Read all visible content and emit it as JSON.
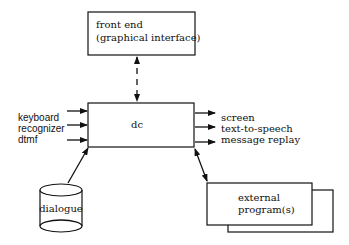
{
  "diagram": {
    "front_end": {
      "line1": "front end",
      "line2": "(graphical interface)"
    },
    "dc": {
      "label": "dc"
    },
    "inputs": [
      {
        "label": "keyboard"
      },
      {
        "label": "recognizer"
      },
      {
        "label": "dtmf"
      }
    ],
    "outputs": [
      {
        "label": "screen"
      },
      {
        "label": "text-to-speech"
      },
      {
        "label": "message replay"
      }
    ],
    "dialogue": {
      "label": "dialogue"
    },
    "external": {
      "line1": "external",
      "line2": "program(s)"
    }
  }
}
